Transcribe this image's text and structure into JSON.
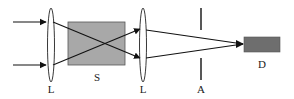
{
  "diagram": {
    "type": "optical-setup",
    "labels": {
      "lens1": "L",
      "sample": "S",
      "lens2": "L",
      "aperture": "A",
      "detector": "D"
    },
    "colors": {
      "line": "#111111",
      "sample_fill": "#a8a8a8",
      "sample_stroke": "#555555",
      "detector_fill": "#6e6e6e",
      "background": "#ffffff"
    },
    "components": [
      {
        "id": "incoming-beams",
        "description": "Two parallel incoming arrows"
      },
      {
        "id": "lens1",
        "label": "L"
      },
      {
        "id": "sample",
        "label": "S"
      },
      {
        "id": "lens2",
        "label": "L"
      },
      {
        "id": "aperture",
        "label": "A"
      },
      {
        "id": "detector",
        "label": "D"
      }
    ]
  }
}
